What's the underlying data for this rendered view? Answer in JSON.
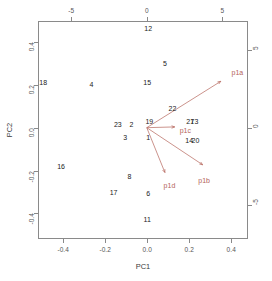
{
  "chart_data": {
    "type": "scatter",
    "title": "",
    "subtitle": "",
    "xlabel": "PC1",
    "ylabel": "PC2",
    "x2label": "",
    "y2label": "",
    "grid": false,
    "legend": false,
    "xlim": [
      -0.52,
      0.48
    ],
    "ylim": [
      -0.52,
      0.5
    ],
    "x2lim": [
      -7.2,
      6.7
    ],
    "y2lim": [
      -7.2,
      6.9
    ],
    "xticks": [
      "-0.4",
      "-0.2",
      "0.0",
      "0.2",
      "0.4"
    ],
    "xtickvals": [
      -0.4,
      -0.2,
      0.0,
      0.2,
      0.4
    ],
    "yticks": [
      "0.4",
      "0.2",
      "0.0",
      "-0.2",
      "-0.4"
    ],
    "ytickvals": [
      0.4,
      0.2,
      0.0,
      -0.2,
      -0.4
    ],
    "x2ticks": [
      "-5",
      "0",
      "5"
    ],
    "x2tickvals": [
      -5,
      0,
      5
    ],
    "y2ticks": [
      "5",
      "0",
      "-5"
    ],
    "y2tickvals": [
      5,
      0,
      -5
    ],
    "point_color": "#1a1a1a",
    "arrow_color": "#b4645a",
    "points": [
      {
        "label": "12",
        "x": 0.005,
        "y": 0.465
      },
      {
        "label": "5",
        "x": 0.085,
        "y": 0.305
      },
      {
        "label": "18",
        "x": -0.495,
        "y": 0.215
      },
      {
        "label": "4",
        "x": -0.265,
        "y": 0.205
      },
      {
        "label": "15",
        "x": 0.0,
        "y": 0.215
      },
      {
        "label": "22",
        "x": 0.12,
        "y": 0.095
      },
      {
        "label": "23",
        "x": -0.14,
        "y": 0.02
      },
      {
        "label": "2",
        "x": -0.075,
        "y": 0.02
      },
      {
        "label": "19",
        "x": 0.01,
        "y": 0.03
      },
      {
        "label": "21",
        "x": 0.205,
        "y": 0.03
      },
      {
        "label": "7",
        "x": 0.215,
        "y": 0.03
      },
      {
        "label": "3",
        "x": 0.235,
        "y": 0.03
      },
      {
        "label": "1",
        "x": 0.005,
        "y": -0.045
      },
      {
        "label": "3",
        "x": -0.105,
        "y": -0.045
      },
      {
        "label": "14",
        "x": 0.2,
        "y": -0.055
      },
      {
        "label": "20",
        "x": 0.23,
        "y": -0.055
      },
      {
        "label": "16",
        "x": -0.41,
        "y": -0.18
      },
      {
        "label": "8",
        "x": -0.085,
        "y": -0.225
      },
      {
        "label": "17",
        "x": -0.16,
        "y": -0.3
      },
      {
        "label": "6",
        "x": 0.005,
        "y": -0.305
      },
      {
        "label": "11",
        "x": 0.0,
        "y": -0.425
      }
    ],
    "arrows": [
      {
        "label": "p1a",
        "x2": 4.9,
        "y2": 3.0,
        "label_x2": 6.0,
        "label_y2": 3.6
      },
      {
        "label": "p1b",
        "x2": 3.7,
        "y2": -2.4,
        "label_x2": 3.8,
        "label_y2": -3.4
      },
      {
        "label": "p1c",
        "x2": 1.85,
        "y2": 0.05,
        "label_x2": 2.55,
        "label_y2": -0.15
      },
      {
        "label": "p1d",
        "x2": 1.2,
        "y2": -2.9,
        "label_x2": 1.5,
        "label_y2": -3.7
      }
    ]
  }
}
